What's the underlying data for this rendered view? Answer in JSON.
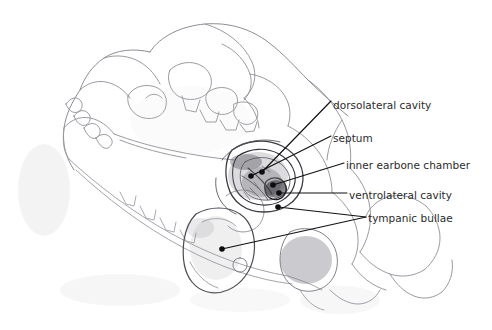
{
  "figure": {
    "kind": "anatomical-line-drawing",
    "background_color": "#ffffff",
    "line_color": "#111111",
    "pencil_color": "#8a8a92",
    "label_color": "#2b2b2b",
    "width": 492,
    "height": 330
  },
  "annotations": [
    {
      "id": "dorsolateral-cavity",
      "label": "dorsolateral cavity",
      "text_x": 333,
      "text_y": 99,
      "leader": [
        [
          331,
          101
        ],
        [
          262,
          172
        ]
      ],
      "anchor": [
        262,
        172
      ],
      "anchor_dot": true
    },
    {
      "id": "septum",
      "label": "septum",
      "text_x": 333,
      "text_y": 132,
      "leader": [
        [
          331,
          136
        ],
        [
          251,
          176
        ]
      ],
      "anchor": [
        251,
        176
      ],
      "anchor_dot": true
    },
    {
      "id": "inner-earbone-chamber",
      "label": "inner earbone chamber",
      "text_x": 346,
      "text_y": 159,
      "leader": [
        [
          344,
          163
        ],
        [
          273,
          185
        ]
      ],
      "anchor": [
        273,
        185
      ],
      "anchor_dot": true
    },
    {
      "id": "ventrolateral-cavity",
      "label": "ventrolateral cavity",
      "text_x": 349,
      "text_y": 189,
      "leader": [
        [
          347,
          193
        ],
        [
          279,
          193
        ]
      ],
      "anchor": [
        279,
        193
      ],
      "anchor_dot": true
    },
    {
      "id": "tympanic-bullae",
      "label": "tympanic bullae",
      "text_x": 368,
      "text_y": 212,
      "leader_a": [
        [
          366,
          217
        ],
        [
          278,
          207
        ]
      ],
      "leader_b": [
        [
          366,
          217
        ],
        [
          222,
          249
        ]
      ],
      "anchor_a": [
        278,
        207
      ],
      "anchor_b": [
        222,
        249
      ],
      "anchor_dot": true
    }
  ],
  "label_list": [
    "dorsolateral cavity",
    "septum",
    "inner earbone chamber",
    "ventrolateral cavity",
    "tympanic bullae"
  ]
}
